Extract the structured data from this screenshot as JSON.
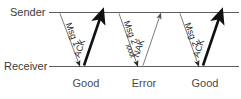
{
  "figure": {
    "type": "sequence-timing-diagram",
    "background_color": "#ffffff",
    "line_color": "#5e5e5e",
    "bold_arrow_color": "#111111",
    "thin_arrow_color": "#6b6b6b",
    "text_color": "#3a3a3a"
  },
  "axes": {
    "sender_label": "Sender",
    "receiver_label": "Receiver"
  },
  "exchanges": [
    {
      "id": "exchange-1",
      "down_label": "Msg 1",
      "down_error_marks": "",
      "up_label": "ACK",
      "up_style": "bold",
      "outcome": "Good"
    },
    {
      "id": "exchange-2",
      "down_label": "Msg 2",
      "down_error_marks": "xxxx",
      "up_label": "NAK",
      "up_style": "thin",
      "outcome": "Error"
    },
    {
      "id": "exchange-3",
      "down_label": "Msg 2",
      "down_error_marks": "",
      "up_label": "ACK",
      "up_style": "bold",
      "outcome": "Good"
    }
  ]
}
